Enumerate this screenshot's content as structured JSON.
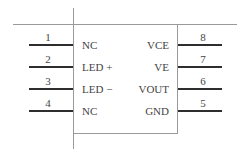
{
  "diagram": {
    "type": "ic-pinout",
    "package_pins": 8,
    "left_pins": [
      {
        "number": "1",
        "signal": "NC"
      },
      {
        "number": "2",
        "signal": "LED +"
      },
      {
        "number": "3",
        "signal": "LED −"
      },
      {
        "number": "4",
        "signal": "NC"
      }
    ],
    "right_pins": [
      {
        "number": "8",
        "signal": "VCE"
      },
      {
        "number": "7",
        "signal": "VE"
      },
      {
        "number": "6",
        "signal": "VOUT"
      },
      {
        "number": "5",
        "signal": "GND"
      }
    ]
  }
}
